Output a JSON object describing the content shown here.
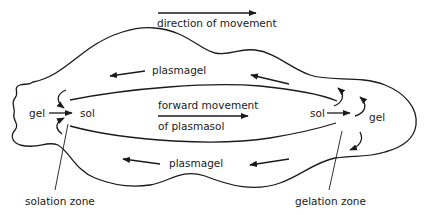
{
  "colors": {
    "line": "#1a1a1a",
    "background": "#ffffff"
  },
  "labels": {
    "direction": "direction of movement",
    "plasmagel_top": "plasmagel",
    "plasmagel_bottom": "plasmagel",
    "forward_line1": "forward movement",
    "forward_line2": "of plasmasol",
    "gel_left": "gel",
    "sol_left": "sol",
    "sol_right": "sol",
    "gel_right": "gel",
    "solation_zone": "solation zone",
    "gelation_zone": "gelation zone"
  }
}
